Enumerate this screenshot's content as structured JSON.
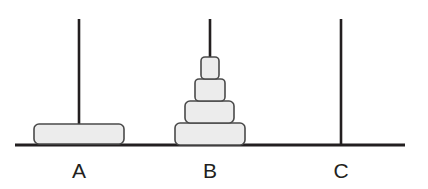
{
  "diagram": {
    "canvas": {
      "width": 428,
      "height": 189
    },
    "colors": {
      "background": "#ffffff",
      "line": "#231f20",
      "disk_fill": "#ececec",
      "disk_stroke": "#4a4a4a",
      "label": "#231f20"
    },
    "base": {
      "x1": 15,
      "x2": 405,
      "y": 145
    },
    "pegs": [
      {
        "id": "A",
        "label": "A",
        "center_x": 79,
        "rod_top_y": 19,
        "rod_bottom_y": 145,
        "label_x": 79,
        "label_y": 172,
        "disk_count": 1,
        "disks": [
          {
            "size": 4,
            "width": 90,
            "height": 20,
            "x": 34,
            "y": 124,
            "radius": 5
          }
        ]
      },
      {
        "id": "B",
        "label": "B",
        "center_x": 210,
        "rod_top_y": 19,
        "rod_bottom_y": 145,
        "label_x": 210,
        "label_y": 172,
        "disk_count": 4,
        "disks": [
          {
            "size": 1,
            "width": 18,
            "height": 22,
            "x": 201,
            "y": 57,
            "radius": 4
          },
          {
            "size": 2,
            "width": 30,
            "height": 22,
            "x": 195,
            "y": 79,
            "radius": 4
          },
          {
            "size": 3,
            "width": 49,
            "height": 22,
            "x": 185,
            "y": 101,
            "radius": 5
          },
          {
            "size": 4,
            "width": 70,
            "height": 22,
            "x": 175,
            "y": 123,
            "radius": 5
          }
        ]
      },
      {
        "id": "C",
        "label": "C",
        "center_x": 341,
        "rod_top_y": 19,
        "rod_bottom_y": 145,
        "label_x": 341,
        "label_y": 172,
        "disk_count": 0,
        "disks": []
      }
    ]
  }
}
